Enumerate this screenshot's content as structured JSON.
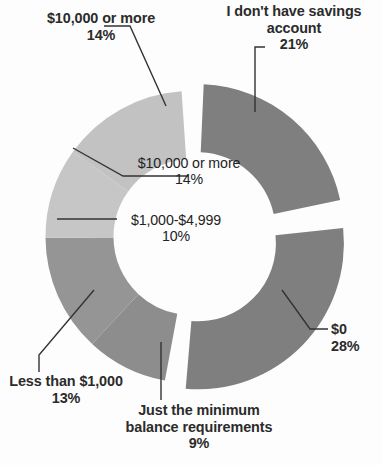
{
  "chart_data": {
    "type": "pie",
    "variant": "donut",
    "title": "",
    "subtitle": "",
    "xlabel": "",
    "ylabel": "",
    "legend": "none",
    "grid": false,
    "value_suffix": "%",
    "categories": [
      "I don't have savings account",
      "$0",
      "Just the minimum balance requirements",
      "Less than $1,000",
      "$1,000-$4,999",
      "$10,000 or more"
    ],
    "values": [
      21,
      28,
      9,
      13,
      10,
      14
    ],
    "colors": [
      "#7f7f7f",
      "#7f7f7f",
      "#8d8d8d",
      "#959595",
      "#c6c6c6",
      "#c2c2c2"
    ],
    "slices": [
      {
        "id": "no-savings-account",
        "label": "I don't have savings account",
        "value": 21,
        "pct_label": "21%",
        "color": "#7f7f7f",
        "start_deg": 2.5,
        "end_deg": 78.1,
        "exploded": true
      },
      {
        "id": "zero-dollars",
        "label": "$0",
        "value": 28,
        "pct_label": "28%",
        "color": "#7f7f7f",
        "start_deg": 84.0,
        "end_deg": 184.8,
        "exploded": true
      },
      {
        "id": "minimum-balance",
        "label": "Just the minimum balance requirements",
        "value": 9,
        "pct_label": "9%",
        "color": "#8d8d8d",
        "start_deg": 190.5,
        "end_deg": 222.9,
        "exploded": false
      },
      {
        "id": "less-than-1000",
        "label": "Less than $1,000",
        "value": 13,
        "pct_label": "13%",
        "color": "#959595",
        "start_deg": 222.9,
        "end_deg": 269.7,
        "exploded": false
      },
      {
        "id": "1000-to-4999",
        "label": "$1,000-$4,999",
        "value": 10,
        "pct_label": "10%",
        "color": "#c6c6c6",
        "start_deg": 269.7,
        "end_deg": 305.7,
        "exploded": false
      },
      {
        "id": "10000-or-more",
        "label": "$10,000 or more",
        "value": 14,
        "pct_label": "14%",
        "color": "#c2c2c2",
        "start_deg": 305.7,
        "end_deg": 356.1,
        "exploded": false
      }
    ]
  },
  "callouts": {
    "top_left": {
      "label": "$10,000 or more",
      "pct": "14%"
    },
    "top_right": {
      "label_line1": "I don't have savings",
      "label_line2": "account",
      "pct": "21%"
    },
    "inner_upper": {
      "label": "$10,000 or more",
      "pct": "14%"
    },
    "inner_lower": {
      "label": "$1,000-$4,999",
      "pct": "10%"
    },
    "right": {
      "label": "$0",
      "pct": "28%"
    },
    "bottom_left": {
      "label": "Less than $1,000",
      "pct": "13%"
    },
    "bottom_center": {
      "label_line1": "Just the minimum",
      "label_line2": "balance requirements",
      "pct": "9%"
    }
  },
  "style": {
    "leader_line_color": "#333333",
    "background": "#fdfdfd",
    "text_color": "#2b2b2b"
  }
}
